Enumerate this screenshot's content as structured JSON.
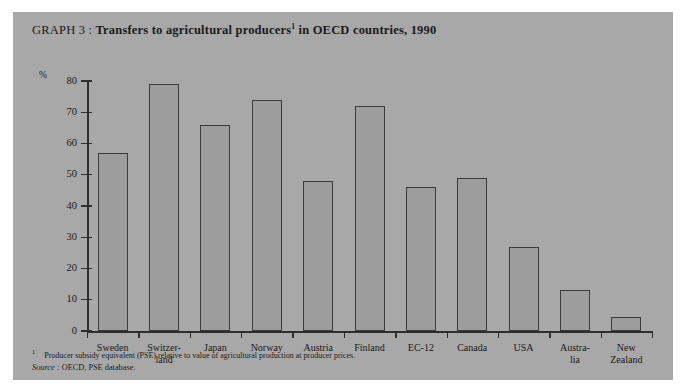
{
  "figure": {
    "title_lead": "GRAPH 3 :",
    "title_main": "Transfers to agricultural producers",
    "title_footnote_marker": "1",
    "title_tail": "in OECD countries, 1990",
    "background_color": "#a8a8a8",
    "bar_fill_color": "#9d9d9d",
    "bar_edge_color": "#3a3a3a",
    "axis_color": "#2e2e2e"
  },
  "notes": {
    "footnote_marker": "1",
    "footnote_text": "Producer subsidy equivalent (PSE) relative to value of agricultural production at producer prices.",
    "source_word": "Source :",
    "source_text": "OECD, PSE database."
  },
  "chart_data": {
    "type": "bar",
    "title": "GRAPH 3 : Transfers to agricultural producers1 in OECD countries, 1990",
    "xlabel": "",
    "ylabel": "%",
    "ylim": [
      0,
      80
    ],
    "yticks": [
      0,
      10,
      20,
      30,
      40,
      50,
      60,
      70,
      80
    ],
    "ytick_labels": [
      "0",
      "10",
      "20",
      "30",
      "40",
      "50",
      "60",
      "70",
      "80"
    ],
    "grid": false,
    "legend": false,
    "categories": [
      "Sweden",
      "Switzer-land",
      "Japan",
      "Norway",
      "Austria",
      "Finland",
      "EC-12",
      "Canada",
      "USA",
      "Austra-lia",
      "New Zealand"
    ],
    "category_lines": [
      [
        "Sweden"
      ],
      [
        "Switzer-",
        "land"
      ],
      [
        "Japan"
      ],
      [
        "Norway"
      ],
      [
        "Austria"
      ],
      [
        "Finland"
      ],
      [
        "EC-12"
      ],
      [
        "Canada"
      ],
      [
        "USA"
      ],
      [
        "Austra-",
        "lia"
      ],
      [
        "New",
        "Zealand"
      ]
    ],
    "values": [
      57,
      79,
      66,
      74,
      48,
      72,
      46,
      49,
      27,
      13,
      4.5
    ]
  }
}
